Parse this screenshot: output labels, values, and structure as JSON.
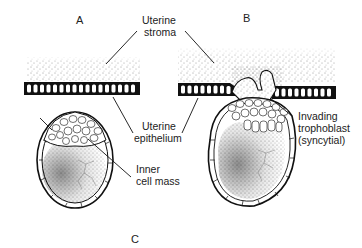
{
  "figure": {
    "panels": [
      {
        "id": "A",
        "label": "A"
      },
      {
        "id": "B",
        "label": "B"
      },
      {
        "id": "C",
        "label": "C"
      }
    ],
    "labels": {
      "uterine_stroma": [
        "Uterine",
        "stroma"
      ],
      "uterine_epithelium": [
        "Uterine",
        "epithelium"
      ],
      "inner_cell_mass": [
        "Inner",
        "cell mass"
      ],
      "invading_trophoblast": [
        "Invading",
        "trophoblast",
        "(syncytial)"
      ]
    }
  }
}
